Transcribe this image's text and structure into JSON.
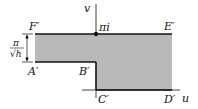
{
  "diagram": {
    "type": "conformal-map-region",
    "colors": {
      "region_fill": "#b9b9b9",
      "stroke": "#111111",
      "background": "#ffffff"
    },
    "axes": {
      "horizontal_label": "u",
      "vertical_label": "v"
    },
    "points": {
      "F": "F′",
      "E": "E′",
      "A": "A′",
      "B": "B′",
      "C": "C′",
      "D": "D′",
      "origin_mark": "πi"
    },
    "dimension": {
      "numerator": "π",
      "denominator": "√h"
    }
  }
}
